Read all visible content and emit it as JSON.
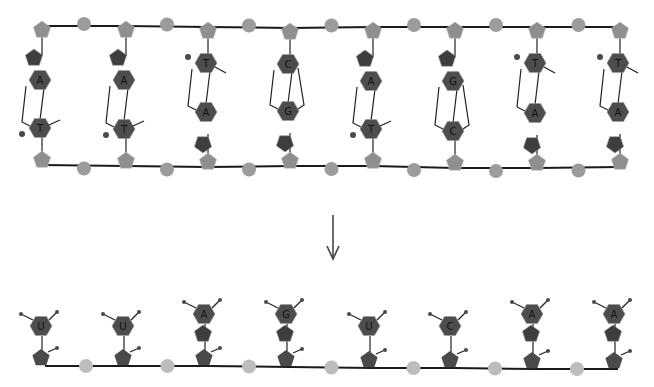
{
  "figure": {
    "dna": {
      "top_strand_bases": [
        "A",
        "A",
        "T",
        "C",
        "A",
        "G",
        "T",
        "T"
      ],
      "bottom_strand_bases": [
        "T",
        "T",
        "A",
        "G",
        "T",
        "C",
        "A",
        "A"
      ],
      "pairs": [
        {
          "top": "A",
          "bottom": "T"
        },
        {
          "top": "A",
          "bottom": "T"
        },
        {
          "top": "T",
          "bottom": "A"
        },
        {
          "top": "C",
          "bottom": "G"
        },
        {
          "top": "A",
          "bottom": "T"
        },
        {
          "top": "G",
          "bottom": "C"
        },
        {
          "top": "T",
          "bottom": "A"
        },
        {
          "top": "T",
          "bottom": "A"
        }
      ]
    },
    "arrow": {
      "direction": "down",
      "icon": "down-arrow-icon"
    },
    "rna": {
      "bases": [
        "U",
        "U",
        "A",
        "G",
        "U",
        "C",
        "A",
        "A"
      ]
    },
    "colors": {
      "backbone_line": "#1a1a1a",
      "dna_sugar": "#8f8f8f",
      "dna_phosphate": "#9c9c9c",
      "base": "#4d4d4d",
      "rna_sugar": "#4a4a4a",
      "rna_phosphate": "#bdbdbd",
      "background": "#ffffff"
    }
  }
}
